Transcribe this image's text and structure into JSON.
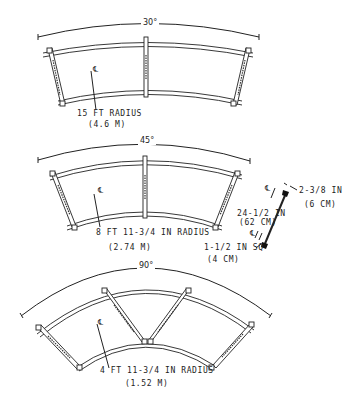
{
  "sections": [
    {
      "id": "section-30",
      "angle_label": "30°",
      "centerline_symbol": "℄",
      "radius_label": "15 FT RADIUS",
      "radius_metric": "(4.6 M)"
    },
    {
      "id": "section-45",
      "angle_label": "45°",
      "centerline_symbol": "℄",
      "radius_label": "8 FT 11-3/4 IN RADIUS",
      "radius_metric": "(2.74 M)"
    },
    {
      "id": "section-90",
      "angle_label": "90°",
      "centerline_symbol": "℄",
      "radius_label": "4 FT 11-3/4 IN RADIUS",
      "radius_metric": "(1.52 M)"
    }
  ],
  "crossbar_detail": {
    "centerline_top": "℄",
    "centerline_bottom": "℄",
    "top_offset_label": "2-3/8 IN",
    "top_offset_metric": "(6 CM)",
    "length_label": "24-1/2 IN",
    "length_metric": "(62 CM)",
    "tube_label": "1-1/2 IN SQ",
    "tube_metric": "(4 CM)"
  }
}
